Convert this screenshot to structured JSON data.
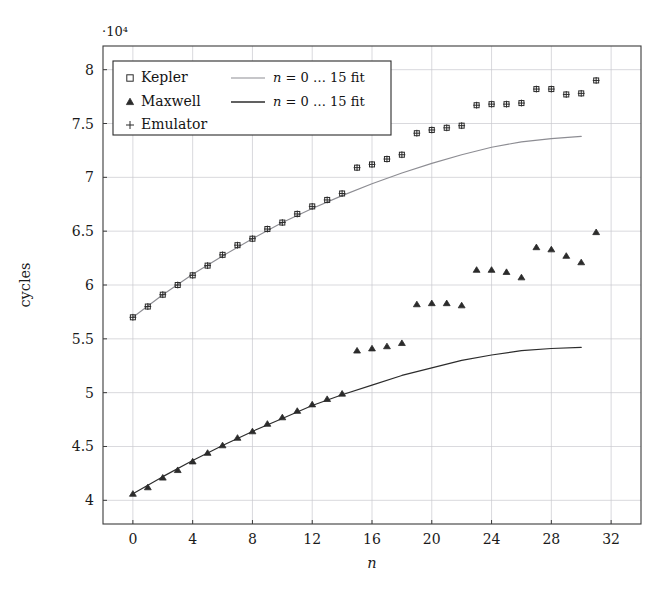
{
  "chart_data": {
    "type": "scatter",
    "title": "",
    "xlabel": "n",
    "ylabel": "cycles",
    "y_exponent_label": "·10⁴",
    "xlim": [
      -2,
      34
    ],
    "ylim": [
      3.78,
      8.22
    ],
    "y_scale_factor": 10000,
    "grid": true,
    "xticks": [
      0,
      4,
      8,
      12,
      16,
      20,
      24,
      28,
      32
    ],
    "xticklabels": [
      "0",
      "4",
      "8",
      "12",
      "16",
      "20",
      "24",
      "28",
      "32"
    ],
    "yticks": [
      4,
      4.5,
      5,
      5.5,
      6,
      6.5,
      7,
      7.5,
      8
    ],
    "yticklabels": [
      "4",
      "4.5",
      "5",
      "5.5",
      "6",
      "6.5",
      "7",
      "7.5",
      "8"
    ],
    "legend_position": "upper-left",
    "legend": [
      {
        "marker": "square",
        "label": "Kepler",
        "fit_label": "n = 0 … 15 fit",
        "fit_color": "#8d8d93"
      },
      {
        "marker": "triangle",
        "label": "Maxwell",
        "fit_label": "n = 0 … 15 fit",
        "fit_color": "#2c2c2c"
      },
      {
        "marker": "plus",
        "label": "Emulator",
        "fit_label": "",
        "fit_color": ""
      }
    ],
    "series": [
      {
        "name": "Kepler",
        "marker": "square",
        "x": [
          0,
          1,
          2,
          3,
          4,
          5,
          6,
          7,
          8,
          9,
          10,
          11,
          12,
          13,
          14,
          15,
          16,
          17,
          18,
          19,
          20,
          21,
          22,
          23,
          24,
          25,
          26,
          27,
          28,
          29,
          30,
          31
        ],
        "values": [
          5.7,
          5.8,
          5.91,
          6.0,
          6.09,
          6.18,
          6.28,
          6.37,
          6.43,
          6.52,
          6.58,
          6.66,
          6.73,
          6.79,
          6.85,
          7.09,
          7.12,
          7.17,
          7.21,
          7.41,
          7.44,
          7.46,
          7.48,
          7.67,
          7.68,
          7.68,
          7.69,
          7.82,
          7.82,
          7.77,
          7.78,
          7.9
        ]
      },
      {
        "name": "Maxwell",
        "marker": "triangle",
        "x": [
          0,
          1,
          2,
          3,
          4,
          5,
          6,
          7,
          8,
          9,
          10,
          11,
          12,
          13,
          14,
          15,
          16,
          17,
          18,
          19,
          20,
          21,
          22,
          23,
          24,
          25,
          26,
          27,
          28,
          29,
          30,
          31
        ],
        "values": [
          4.06,
          4.12,
          4.21,
          4.28,
          4.36,
          4.44,
          4.51,
          4.58,
          4.64,
          4.71,
          4.77,
          4.83,
          4.89,
          4.94,
          4.99,
          5.39,
          5.41,
          5.43,
          5.46,
          5.82,
          5.83,
          5.83,
          5.81,
          6.14,
          6.14,
          6.12,
          6.07,
          6.35,
          6.33,
          6.27,
          6.21,
          6.49
        ]
      },
      {
        "name": "Emulator",
        "marker": "plus",
        "x": [
          0,
          1,
          2,
          3,
          4,
          5,
          6,
          7,
          8,
          9,
          10,
          11,
          12,
          13,
          14,
          15,
          16,
          17,
          18,
          19,
          20,
          21,
          22,
          23,
          24,
          25,
          26,
          27,
          28,
          29,
          30,
          31
        ],
        "values": [
          5.7,
          5.8,
          5.91,
          6.0,
          6.09,
          6.18,
          6.28,
          6.37,
          6.43,
          6.52,
          6.58,
          6.66,
          6.73,
          6.79,
          6.85,
          7.09,
          7.12,
          7.17,
          7.21,
          7.41,
          7.44,
          7.46,
          7.48,
          7.67,
          7.68,
          7.68,
          7.69,
          7.82,
          7.82,
          7.77,
          7.78,
          7.9
        ]
      }
    ],
    "fits": [
      {
        "name": "Kepler fit",
        "label": "n = 0 … 15 fit",
        "color": "#8d8d93",
        "x_range": [
          0,
          30
        ],
        "x": [
          0,
          2,
          4,
          6,
          8,
          10,
          12,
          14,
          16,
          18,
          20,
          22,
          24,
          26,
          28,
          30
        ],
        "values": [
          5.7,
          5.91,
          6.1,
          6.27,
          6.43,
          6.58,
          6.71,
          6.83,
          6.94,
          7.04,
          7.13,
          7.21,
          7.28,
          7.33,
          7.36,
          7.38
        ]
      },
      {
        "name": "Maxwell fit",
        "label": "n = 0 … 15 fit",
        "color": "#2c2c2c",
        "x_range": [
          0,
          30
        ],
        "x": [
          0,
          2,
          4,
          6,
          8,
          10,
          12,
          14,
          16,
          18,
          20,
          22,
          24,
          26,
          28,
          30
        ],
        "values": [
          4.06,
          4.22,
          4.37,
          4.51,
          4.64,
          4.76,
          4.88,
          4.98,
          5.07,
          5.16,
          5.23,
          5.3,
          5.35,
          5.39,
          5.41,
          5.42
        ]
      }
    ]
  }
}
